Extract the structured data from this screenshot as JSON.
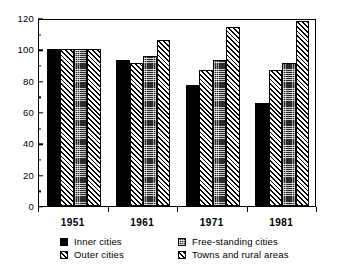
{
  "chart_data": {
    "type": "bar",
    "title": "",
    "subtitle": "",
    "xlabel": "",
    "ylabel": "",
    "categories": [
      "1951",
      "1961",
      "1971",
      "1981"
    ],
    "series": [
      {
        "name": "Inner cities",
        "pattern": "solid",
        "values": [
          100,
          93,
          77,
          65.5
        ]
      },
      {
        "name": "Outer cities",
        "pattern": "hatch",
        "values": [
          100,
          91.5,
          87,
          87
        ]
      },
      {
        "name": "Free-standing cities",
        "pattern": "stipple",
        "values": [
          100,
          96,
          93.5,
          91
        ]
      },
      {
        "name": "Towns and rural areas",
        "pattern": "hatch",
        "values": [
          100,
          106,
          114.5,
          118
        ]
      }
    ],
    "ylim": [
      0,
      120
    ],
    "y_major_ticks": [
      0,
      20,
      40,
      60,
      80,
      100,
      120
    ],
    "y_minor_ticks": [
      10,
      30,
      50,
      70,
      90,
      110
    ],
    "y_tick_labels": [
      "0",
      "20",
      "40",
      "60",
      "80",
      "100",
      "120"
    ],
    "grid": false,
    "legend_position": "bottom",
    "colors": {
      "foreground": "#000000",
      "background": "#ffffff",
      "stipple_fill": "#2a2a2a"
    }
  },
  "legend": {
    "items": [
      {
        "label": "Inner cities",
        "pattern": "solid"
      },
      {
        "label": "Free-standing cities",
        "pattern": "stipple"
      },
      {
        "label": "Outer cities",
        "pattern": "hatch"
      },
      {
        "label": "Towns and rural areas",
        "pattern": "hatch"
      }
    ]
  }
}
